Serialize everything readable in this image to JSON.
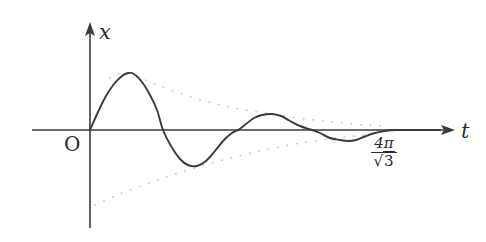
{
  "figure": {
    "background_color": "#ffffff",
    "curve_color": "#3a3a3a",
    "axis_color": "#3a3a3a",
    "envelope_color": "#c9c9c9",
    "text_color": "#2b2b2b"
  },
  "labels": {
    "y_axis": "x",
    "x_axis": "t",
    "origin": "O",
    "tick_numerator": "4π",
    "tick_denominator": "3",
    "tick_radical": "√",
    "tick_full": "4π/√3"
  },
  "chart_data": {
    "type": "line",
    "xlabel": "t",
    "ylabel": "x",
    "grid": false,
    "legend": null,
    "annotations": [
      {
        "text": "O",
        "role": "origin-label"
      },
      {
        "text": "4π/√3",
        "role": "x-axis-tick-label"
      }
    ],
    "axes": {
      "x_origin_px": 90,
      "y_origin_px": 130,
      "x_arrow_tip_px": 455,
      "y_arrow_tip_px": 22,
      "x_axis_start_px": 32,
      "y_axis_end_px": 228
    },
    "model": {
      "equation": "x(t) = A e^(-lambda t) sin(omega t)",
      "amplitude_px": 60,
      "decay_per_px": 0.0062,
      "period_px": 150,
      "phase": 0
    },
    "series": [
      {
        "name": "x(t)",
        "style": "solid",
        "color": "#3a3a3a",
        "points_px": [
          [
            90,
            130
          ],
          [
            98,
            112
          ],
          [
            106,
            96
          ],
          [
            114,
            84
          ],
          [
            122,
            76
          ],
          [
            128,
            73
          ],
          [
            134,
            74
          ],
          [
            142,
            82
          ],
          [
            150,
            95
          ],
          [
            157,
            110
          ],
          [
            163,
            130
          ],
          [
            171,
            146
          ],
          [
            180,
            159
          ],
          [
            188,
            165
          ],
          [
            197,
            166
          ],
          [
            206,
            161
          ],
          [
            215,
            151
          ],
          [
            224,
            140
          ],
          [
            232,
            133
          ],
          [
            238,
            130
          ],
          [
            246,
            124
          ],
          [
            254,
            118
          ],
          [
            262,
            115
          ],
          [
            272,
            114
          ],
          [
            281,
            116
          ],
          [
            290,
            121
          ],
          [
            300,
            126
          ],
          [
            312,
            130
          ],
          [
            320,
            133
          ],
          [
            330,
            138
          ],
          [
            340,
            140
          ],
          [
            348,
            141
          ],
          [
            356,
            140
          ],
          [
            366,
            136
          ],
          [
            375,
            133
          ],
          [
            385,
            131
          ],
          [
            396,
            130
          ],
          [
            410,
            130
          ],
          [
            424,
            130
          ],
          [
            440,
            130
          ]
        ]
      },
      {
        "name": "upper envelope",
        "style": "dotted",
        "color": "#c9c9c9",
        "points_px": [
          [
            110,
            78
          ],
          [
            125,
            72
          ],
          [
            145,
            80
          ],
          [
            165,
            88
          ],
          [
            185,
            95
          ],
          [
            205,
            101
          ],
          [
            225,
            106
          ],
          [
            245,
            110
          ],
          [
            265,
            113
          ],
          [
            285,
            116
          ],
          [
            305,
            119
          ],
          [
            325,
            121
          ],
          [
            345,
            123
          ],
          [
            365,
            125
          ],
          [
            385,
            126
          ]
        ]
      },
      {
        "name": "lower envelope",
        "style": "dotted",
        "color": "#c9c9c9",
        "points_px": [
          [
            95,
            205
          ],
          [
            115,
            196
          ],
          [
            135,
            188
          ],
          [
            155,
            181
          ],
          [
            175,
            174
          ],
          [
            195,
            168
          ],
          [
            215,
            162
          ],
          [
            235,
            157
          ],
          [
            255,
            152
          ],
          [
            275,
            148
          ],
          [
            295,
            144
          ],
          [
            315,
            141
          ],
          [
            335,
            138
          ],
          [
            355,
            136
          ],
          [
            375,
            134
          ]
        ]
      }
    ],
    "zero_crossings_px": [
      90,
      163,
      238,
      312,
      385
    ],
    "extrema_px": [
      {
        "label": "peak-1",
        "x": 128,
        "y": 73
      },
      {
        "label": "trough-1",
        "x": 197,
        "y": 166
      },
      {
        "label": "peak-2",
        "x": 272,
        "y": 114
      },
      {
        "label": "trough-2",
        "x": 348,
        "y": 141
      }
    ]
  }
}
